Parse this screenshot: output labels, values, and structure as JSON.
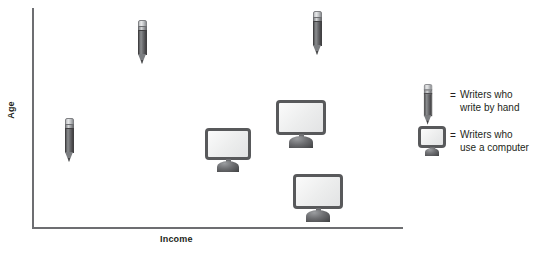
{
  "chart": {
    "type": "scatter",
    "title": "",
    "xlabel": "Income",
    "ylabel": "Age"
  },
  "legend": {
    "rows": [
      {
        "key": "pencil-icon",
        "equals": "=",
        "text": "Writers who\nwrite by hand"
      },
      {
        "key": "monitor-icon",
        "equals": "=",
        "text": "Writers who\nuse a computer"
      }
    ]
  },
  "chart_data": {
    "type": "scatter",
    "title": "",
    "xlabel": "Income",
    "ylabel": "Age",
    "xlim": [
      0,
      100
    ],
    "ylim": [
      0,
      100
    ],
    "grid": false,
    "axis_ticks": false,
    "legend_position": "right",
    "series": [
      {
        "name": "Writers who write by hand",
        "marker": "pencil-icon",
        "points": [
          {
            "x": 10,
            "y": 40
          },
          {
            "x": 30,
            "y": 85
          },
          {
            "x": 78,
            "y": 89
          }
        ]
      },
      {
        "name": "Writers who use a computer",
        "marker": "monitor-icon",
        "points": [
          {
            "x": 53,
            "y": 35
          },
          {
            "x": 73,
            "y": 48
          },
          {
            "x": 77,
            "y": 14
          }
        ]
      }
    ]
  },
  "markers": {
    "pencils": [
      {
        "name": "pencil-marker-1",
        "left": 64,
        "top": 118
      },
      {
        "name": "pencil-marker-2",
        "left": 137,
        "top": 20
      },
      {
        "name": "pencil-marker-3",
        "left": 312,
        "top": 11
      }
    ],
    "monitors": [
      {
        "name": "monitor-marker-1",
        "left": 205,
        "top": 128,
        "width": 46,
        "height": 44
      },
      {
        "name": "monitor-marker-2",
        "left": 276,
        "top": 100,
        "width": 50,
        "height": 48
      },
      {
        "name": "monitor-marker-3",
        "left": 293,
        "top": 174,
        "width": 50,
        "height": 48
      }
    ]
  }
}
